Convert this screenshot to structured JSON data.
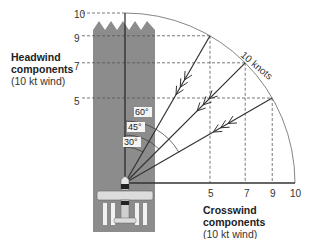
{
  "headwind_title": {
    "line1": "Headwind",
    "line2": "components",
    "line3": "(10 kt wind)"
  },
  "crosswind_title": {
    "line1": "Crosswind components",
    "line2": "(10 kt wind)"
  },
  "wind_label": "10 knots",
  "y_ticks": [
    "10",
    "9",
    "7",
    "5"
  ],
  "x_ticks": [
    "5",
    "7",
    "9",
    "10"
  ],
  "angles": [
    {
      "label": "60°",
      "degrees": 60,
      "headwind": 5,
      "crosswind": 8.66
    },
    {
      "label": "45°",
      "degrees": 45,
      "headwind": 7.07,
      "crosswind": 7.07
    },
    {
      "label": "30°",
      "degrees": 30,
      "headwind": 8.66,
      "crosswind": 5
    }
  ],
  "wind_speed_kt": 10,
  "colors": {
    "runway": "#8c8c8c",
    "line": "#333333",
    "dash": "#555555",
    "arc": "#777777",
    "airplane": "#d9d9d9"
  }
}
